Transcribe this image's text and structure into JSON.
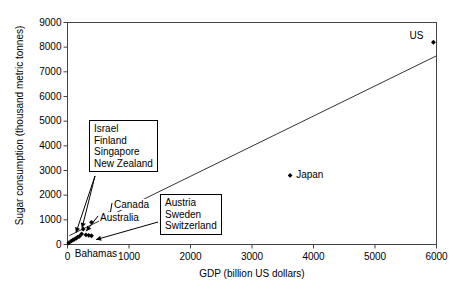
{
  "chart_data": {
    "type": "scatter",
    "title": "",
    "xlabel": "GDP (billion US dollars)",
    "ylabel": "Sugar consumption (thousand metric tonnes)",
    "xlim": [
      0,
      6000
    ],
    "ylim": [
      0,
      9000
    ],
    "xticks": [
      0,
      1000,
      2000,
      3000,
      4000,
      5000,
      6000
    ],
    "yticks": [
      0,
      1000,
      2000,
      3000,
      4000,
      5000,
      6000,
      7000,
      8000,
      9000
    ],
    "xtick_labels": [
      "0",
      "1000",
      "2000",
      "3000",
      "4000",
      "5000",
      "6000"
    ],
    "ytick_labels": [
      "0",
      "1000",
      "2000",
      "3000",
      "4000",
      "5000",
      "6000",
      "7000",
      "8000",
      "9000"
    ],
    "grid": false,
    "legend": false,
    "marker": "filled-diamond",
    "marker_color": "#000000",
    "points": [
      {
        "label": "US",
        "x": 5950,
        "y": 8200
      },
      {
        "label": "Japan",
        "x": 3620,
        "y": 2800
      },
      {
        "label": "",
        "x": 620,
        "y": 1160
      },
      {
        "label": "",
        "x": 390,
        "y": 900
      },
      {
        "label": "",
        "x": 255,
        "y": 620
      },
      {
        "label": "",
        "x": 230,
        "y": 430
      },
      {
        "label": "",
        "x": 300,
        "y": 390
      },
      {
        "label": "",
        "x": 345,
        "y": 370
      },
      {
        "label": "",
        "x": 390,
        "y": 355
      },
      {
        "label": "",
        "x": 195,
        "y": 330
      },
      {
        "label": "",
        "x": 165,
        "y": 300
      },
      {
        "label": "",
        "x": 140,
        "y": 250
      },
      {
        "label": "",
        "x": 110,
        "y": 210
      },
      {
        "label": "",
        "x": 85,
        "y": 175
      },
      {
        "label": "",
        "x": 60,
        "y": 140
      },
      {
        "label": "Bahamas",
        "x": 20,
        "y": 60
      }
    ],
    "trendline": {
      "x0": 30,
      "y0": 360,
      "x1": 6000,
      "y1": 7650
    },
    "annotations": [
      {
        "id": "group-israel",
        "kind": "boxed-callout",
        "lines": [
          "Israel",
          "Finland",
          "Singapore",
          "New Zealand"
        ],
        "target": {
          "x": 235,
          "y": 560
        }
      },
      {
        "id": "group-austria",
        "kind": "boxed-callout",
        "lines": [
          "Austria",
          "Sweden",
          "Switzerland"
        ],
        "target": {
          "x": 400,
          "y": 360
        }
      },
      {
        "id": "label-canada",
        "kind": "plain-label",
        "text": "Canada",
        "target": {
          "x": 620,
          "y": 1160
        }
      },
      {
        "id": "label-australia",
        "kind": "plain-label",
        "text": "Australia",
        "target": {
          "x": 255,
          "y": 620
        }
      }
    ],
    "point_labels": [
      {
        "text": "US",
        "anchor": "left"
      },
      {
        "text": "Japan",
        "anchor": "right"
      },
      {
        "text": "Bahamas",
        "anchor": "below-right"
      }
    ]
  }
}
